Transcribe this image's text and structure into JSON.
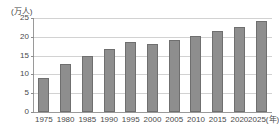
{
  "chart_data": {
    "type": "bar",
    "title": "",
    "xlabel": "年",
    "ylabel": "万人",
    "y_unit_caption": "(万人)",
    "x_unit_caption": "(年)",
    "categories": [
      "1975",
      "1980",
      "1985",
      "1990",
      "1995",
      "2000",
      "2005",
      "2010",
      "2015",
      "2020",
      "2025"
    ],
    "values": [
      9.0,
      12.7,
      14.9,
      16.8,
      18.5,
      18.2,
      19.2,
      20.1,
      21.5,
      22.7,
      24.1
    ],
    "ylim": [
      0,
      25
    ],
    "ytick_labels": [
      "0",
      "5",
      "10",
      "15",
      "20",
      "25"
    ],
    "ytick_values": [
      0,
      5,
      10,
      15,
      20,
      25
    ],
    "grid": true,
    "legend": "none",
    "bar_color": "#8e8e8e",
    "bar_border_color": "#6f6f6f",
    "grid_color": "#d2d2d2",
    "axis_color": "#9a9a9a"
  }
}
